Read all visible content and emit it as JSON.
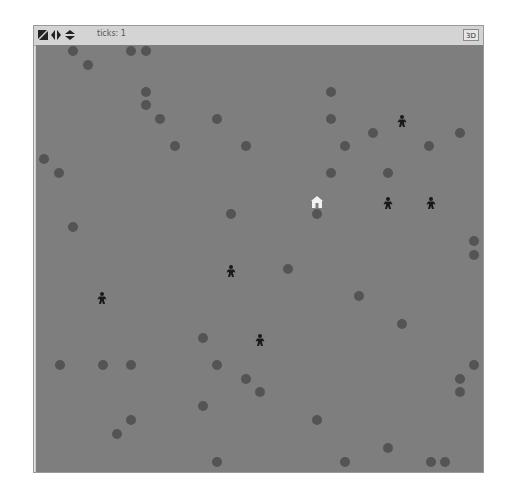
{
  "toolbar": {
    "icons": [
      "edit-shape-icon",
      "horizontal-wrap-icon",
      "vertical-wrap-icon"
    ],
    "ticks_label": "ticks: 1",
    "view_3d_label": "3D"
  },
  "world": {
    "background": "#7e7e7e",
    "dot_color": "#545454",
    "agent_color": "#1a1a1a",
    "house_color": "#f2f2f2",
    "dots": [
      [
        72,
        50
      ],
      [
        130,
        50
      ],
      [
        145,
        50
      ],
      [
        87,
        64
      ],
      [
        145,
        91
      ],
      [
        145,
        104
      ],
      [
        159,
        118
      ],
      [
        216,
        118
      ],
      [
        174,
        145
      ],
      [
        43,
        158
      ],
      [
        58,
        172
      ],
      [
        330,
        91
      ],
      [
        330,
        118
      ],
      [
        372,
        132
      ],
      [
        459,
        132
      ],
      [
        344,
        145
      ],
      [
        245,
        145
      ],
      [
        428,
        145
      ],
      [
        387,
        172
      ],
      [
        330,
        172
      ],
      [
        230,
        213
      ],
      [
        72,
        226
      ],
      [
        316,
        213
      ],
      [
        473,
        240
      ],
      [
        473,
        254
      ],
      [
        287,
        268
      ],
      [
        358,
        295
      ],
      [
        401,
        323
      ],
      [
        202,
        337
      ],
      [
        59,
        364
      ],
      [
        102,
        364
      ],
      [
        130,
        364
      ],
      [
        216,
        364
      ],
      [
        245,
        378
      ],
      [
        259,
        391
      ],
      [
        202,
        405
      ],
      [
        130,
        419
      ],
      [
        116,
        433
      ],
      [
        216,
        461
      ],
      [
        316,
        419
      ],
      [
        473,
        364
      ],
      [
        459,
        378
      ],
      [
        459,
        391
      ],
      [
        387,
        447
      ],
      [
        344,
        461
      ],
      [
        430,
        461
      ],
      [
        444,
        461
      ]
    ],
    "agents": [
      [
        401,
        120
      ],
      [
        387,
        202
      ],
      [
        430,
        202
      ],
      [
        230,
        270
      ],
      [
        101,
        297
      ],
      [
        259,
        339
      ]
    ],
    "house": [
      316,
      202
    ]
  }
}
